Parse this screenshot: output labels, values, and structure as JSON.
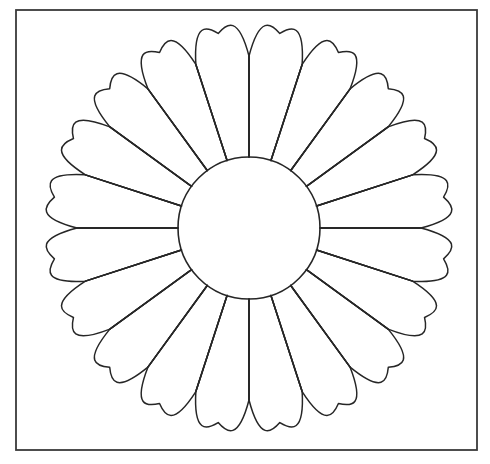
{
  "document": {
    "title": "Chrysanthemum Rosette Outline",
    "type": "line-art-illustration",
    "background_color": "#ffffff",
    "width": 490,
    "height": 464
  },
  "frame": {
    "name": "outer-border-rectangle",
    "x": 16,
    "y": 10,
    "width": 461,
    "height": 440,
    "stroke_color": "#3a3a3a",
    "stroke_width": 1.8,
    "fill": "none"
  },
  "rosette": {
    "name": "twenty-petal-rosette",
    "center_x": 249,
    "center_y": 228,
    "petal_count": 20,
    "petal_angle_step_deg": 18,
    "inner_circle_radius": 71,
    "petal_outer_radius": 198,
    "petal_tip_radius": 197,
    "petal_notch_radius": 172,
    "stroke_color": "#262626",
    "stroke_width": 1.5,
    "fill": "none",
    "divider_start_radius": 71,
    "divider_end_radius": 172,
    "boundary_angles_deg": [
      0,
      18,
      36,
      54,
      72,
      90,
      108,
      126,
      144,
      162,
      180,
      198,
      216,
      234,
      252,
      270,
      288,
      306,
      324,
      342
    ]
  },
  "inner_circle": {
    "name": "central-circle",
    "center_x": 249,
    "center_y": 228,
    "radius": 71,
    "stroke_color": "#262626",
    "stroke_width": 1.6,
    "fill": "none"
  },
  "labels": {
    "caption": "",
    "annotation": ""
  }
}
